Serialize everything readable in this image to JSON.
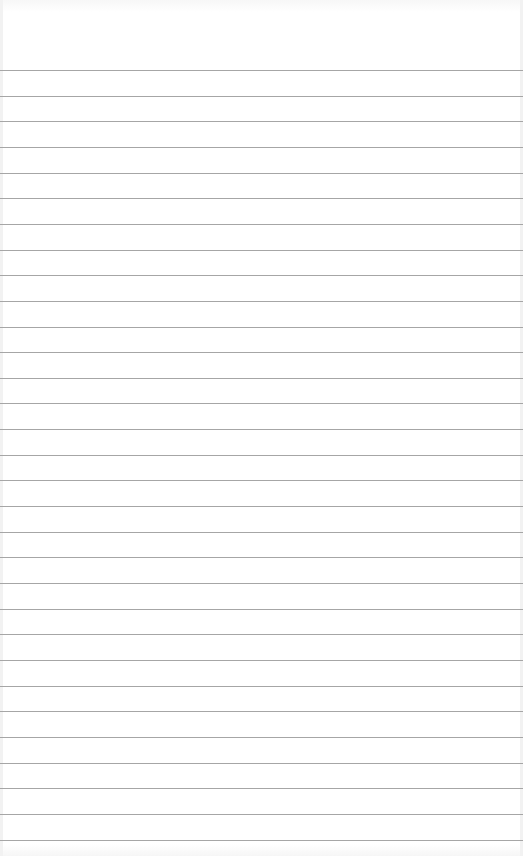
{
  "paper": {
    "type": "lined-paper",
    "background_color": "#ffffff",
    "rule_color": "#a6a6a6",
    "first_rule_y": 70,
    "rule_spacing": 25.65,
    "rule_count": 31
  }
}
